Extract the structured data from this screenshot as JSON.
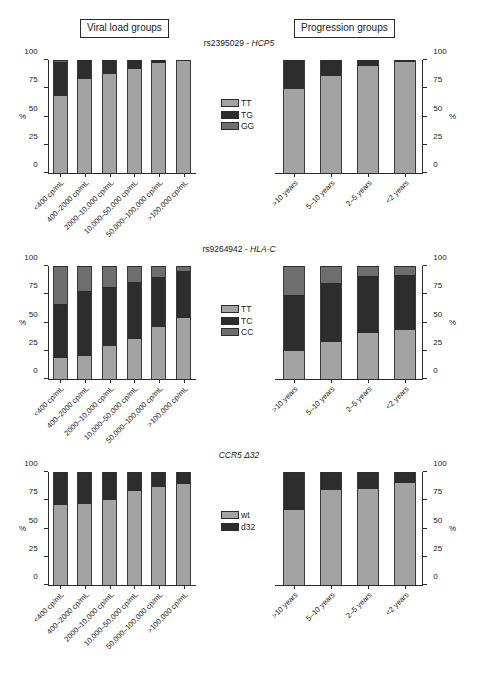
{
  "headers": {
    "viral_load": "Viral load groups",
    "progression": "Progression groups"
  },
  "axis": {
    "unit": "%",
    "ticks": [
      "0",
      "25",
      "50",
      "75",
      "100"
    ]
  },
  "categories": {
    "viral_load": [
      "<400 cp/mL",
      "400–2000 cp/mL",
      "2000–10,000 cp/mL",
      "10,000–50,000 cp/mL",
      "50,000–100,000 cp/mL",
      ">100,000 cp/mL"
    ],
    "progression": [
      ">10 years",
      "5–10 years",
      "2–5 years",
      "<2 years"
    ]
  },
  "colors": {
    "light_gray": "#a3a3a3",
    "dark": "#2d2d2d",
    "mid_gray": "#6e6e6e",
    "axis": "#2b2b2b"
  },
  "panels": [
    {
      "id": "hcp5",
      "title_rs": "rs2395029 - ",
      "title_gene": "HCP5",
      "legend": [
        "TT",
        "TG",
        "GG"
      ]
    },
    {
      "id": "hlac",
      "title_rs": "rs9264942 - ",
      "title_gene": "HLA-C",
      "legend": [
        "TT",
        "TC",
        "CC"
      ]
    },
    {
      "id": "ccr5",
      "title_rs": "",
      "title_gene": "CCR5 Δ32",
      "legend": [
        "wt",
        "d32"
      ]
    }
  ],
  "chart_data": [
    {
      "type": "bar",
      "title": "rs2395029 - HCP5",
      "subtitle": "Viral load groups",
      "stacked": true,
      "xlabel": "",
      "ylabel": "%",
      "ylim": [
        0,
        100
      ],
      "yticks": [
        0,
        25,
        50,
        75,
        100
      ],
      "grid": false,
      "legend_position": "center-right",
      "categories": [
        "<400 cp/mL",
        "400–2000 cp/mL",
        "2000–10,000 cp/mL",
        "10,000–50,000 cp/mL",
        "50,000–100,000 cp/mL",
        ">100,000 cp/mL"
      ],
      "series": [
        {
          "name": "TT",
          "color": "#a3a3a3",
          "values": [
            68,
            83,
            88,
            92,
            98,
            99.5
          ]
        },
        {
          "name": "TG",
          "color": "#2d2d2d",
          "values": [
            30,
            16,
            11,
            8,
            1.5,
            0.5
          ]
        },
        {
          "name": "GG",
          "color": "#6e6e6e",
          "values": [
            2,
            1,
            1,
            0,
            0.5,
            0
          ]
        }
      ]
    },
    {
      "type": "bar",
      "title": "rs2395029 - HCP5",
      "subtitle": "Progression groups",
      "stacked": true,
      "xlabel": "",
      "ylabel": "%",
      "ylim": [
        0,
        100
      ],
      "yticks": [
        0,
        25,
        50,
        75,
        100
      ],
      "grid": false,
      "legend_position": "center-left",
      "categories": [
        ">10 years",
        "5–10 years",
        "2–5 years",
        "<2 years"
      ],
      "series": [
        {
          "name": "TT",
          "color": "#a3a3a3",
          "values": [
            74,
            86,
            95,
            98
          ]
        },
        {
          "name": "TG",
          "color": "#2d2d2d",
          "values": [
            26,
            14,
            5,
            2
          ]
        },
        {
          "name": "GG",
          "color": "#6e6e6e",
          "values": [
            0,
            0,
            0,
            0
          ]
        }
      ]
    },
    {
      "type": "bar",
      "title": "rs9264942 - HLA-C",
      "subtitle": "Viral load groups",
      "stacked": true,
      "xlabel": "",
      "ylabel": "%",
      "ylim": [
        0,
        100
      ],
      "yticks": [
        0,
        25,
        50,
        75,
        100
      ],
      "grid": false,
      "legend_position": "center-right",
      "categories": [
        "<400 cp/mL",
        "400–2000 cp/mL",
        "2000–10,000 cp/mL",
        "10,000–50,000 cp/mL",
        "50,000–100,000 cp/mL",
        ">100,000 cp/mL"
      ],
      "series": [
        {
          "name": "TT",
          "color": "#a3a3a3",
          "values": [
            19,
            20,
            29,
            35,
            46,
            54
          ]
        },
        {
          "name": "TC",
          "color": "#2d2d2d",
          "values": [
            47,
            58,
            52,
            51,
            44,
            42
          ]
        },
        {
          "name": "CC",
          "color": "#6e6e6e",
          "values": [
            34,
            22,
            19,
            14,
            10,
            4
          ]
        }
      ]
    },
    {
      "type": "bar",
      "title": "rs9264942 - HLA-C",
      "subtitle": "Progression groups",
      "stacked": true,
      "xlabel": "",
      "ylabel": "%",
      "ylim": [
        0,
        100
      ],
      "yticks": [
        0,
        25,
        50,
        75,
        100
      ],
      "grid": false,
      "legend_position": "center-left",
      "categories": [
        ">10 years",
        "5–10 years",
        "2–5 years",
        "<2 years"
      ],
      "series": [
        {
          "name": "TT",
          "color": "#a3a3a3",
          "values": [
            25,
            33,
            41,
            43
          ]
        },
        {
          "name": "TC",
          "color": "#2d2d2d",
          "values": [
            49,
            52,
            50,
            49
          ]
        },
        {
          "name": "CC",
          "color": "#6e6e6e",
          "values": [
            26,
            15,
            9,
            8
          ]
        }
      ]
    },
    {
      "type": "bar",
      "title": "CCR5 Δ32",
      "subtitle": "Viral load groups",
      "stacked": true,
      "xlabel": "",
      "ylabel": "%",
      "ylim": [
        0,
        100
      ],
      "yticks": [
        0,
        25,
        50,
        75,
        100
      ],
      "grid": false,
      "legend_position": "center-right",
      "categories": [
        "<400 cp/mL",
        "400–2000 cp/mL",
        "2000–10,000 cp/mL",
        "10,000–50,000 cp/mL",
        "50,000–100,000 cp/mL",
        ">100,000 cp/mL"
      ],
      "series": [
        {
          "name": "wt",
          "color": "#a3a3a3",
          "values": [
            71,
            72,
            75,
            83,
            87,
            89
          ]
        },
        {
          "name": "d32",
          "color": "#2d2d2d",
          "values": [
            29,
            28,
            25,
            17,
            13,
            11
          ]
        }
      ]
    },
    {
      "type": "bar",
      "title": "CCR5 Δ32",
      "subtitle": "Progression groups",
      "stacked": true,
      "xlabel": "",
      "ylabel": "%",
      "ylim": [
        0,
        100
      ],
      "yticks": [
        0,
        25,
        50,
        75,
        100
      ],
      "grid": false,
      "legend_position": "center-left",
      "categories": [
        ">10 years",
        "5–10 years",
        "2–5 years",
        "<2 years"
      ],
      "series": [
        {
          "name": "wt",
          "color": "#a3a3a3",
          "values": [
            66,
            84,
            85,
            90
          ]
        },
        {
          "name": "d32",
          "color": "#2d2d2d",
          "values": [
            34,
            16,
            15,
            10
          ]
        }
      ]
    }
  ]
}
